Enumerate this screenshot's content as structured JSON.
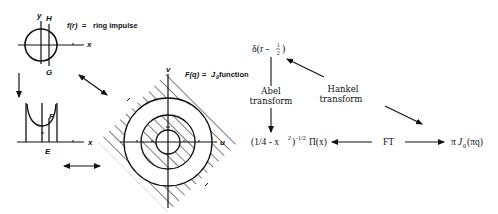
{
  "left_panel": {
    "top_plot": {
      "axis_x": "x",
      "axis_y": "y",
      "label_H": "H",
      "label_G": "G",
      "title": "f(r)",
      "equals": "=",
      "description": "ring impulse"
    },
    "bottom_plot": {
      "axis_x": "x",
      "label_F": "F",
      "label_E": "E"
    },
    "fourier_plot": {
      "axis_u": "u",
      "axis_v": "v",
      "title": "F(q)",
      "equals": "=",
      "description_pre": "J",
      "description_sub": "0",
      "description_post": " function"
    }
  },
  "right_panel": {
    "top_node": {
      "pre": "δ(r - ",
      "frac_num": "1",
      "frac_den": "2",
      "post": ")"
    },
    "abel": {
      "line1": "Abel",
      "line2": "transform"
    },
    "hankel": {
      "line1": "Hankel",
      "line2": "transform"
    },
    "bottom_left_node": {
      "base": "(1/4 - x",
      "sq": "2",
      "close": ")",
      "exp": "-1/2",
      "tail": "Π(x)"
    },
    "ft_label": "FT",
    "bottom_right_node": {
      "pi": "π",
      "J": "J",
      "sub": "0",
      "arg": "(πq)"
    }
  },
  "colors": {
    "ink": "#111111",
    "background": "#ffffff"
  }
}
